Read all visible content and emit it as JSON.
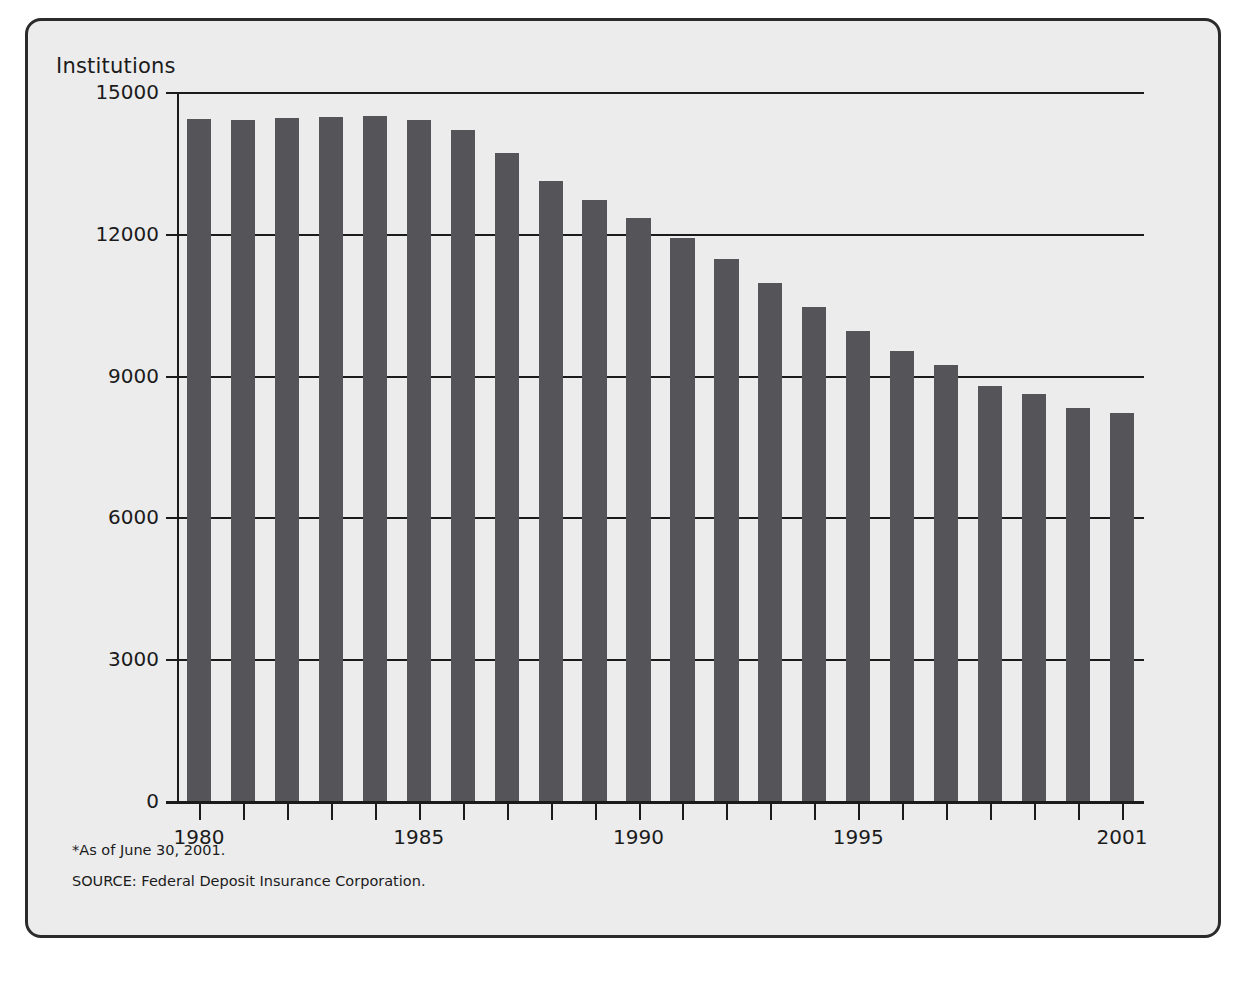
{
  "figure": {
    "y_axis_title": "Institutions",
    "footnote": "*As of June 30, 2001.",
    "source": "SOURCE: Federal Deposit Insurance Corporation.",
    "bar_color": "#555559",
    "background_color": "#ececed",
    "axis_color": "#1b1b1b"
  },
  "chart_data": {
    "type": "bar",
    "title": "",
    "subtitle": "",
    "xlabel": "",
    "ylabel": "Institutions",
    "ylim": [
      0,
      15000
    ],
    "yticks": [
      0,
      3000,
      6000,
      9000,
      12000,
      15000
    ],
    "ytick_labels": [
      "0",
      "3000",
      "6000",
      "9000",
      "12000",
      "15000"
    ],
    "grid": true,
    "legend": false,
    "categories": [
      "1980",
      "1981",
      "1982",
      "1983",
      "1984",
      "1985",
      "1986",
      "1987",
      "1988",
      "1989",
      "1990",
      "1991",
      "1992",
      "1993",
      "1994",
      "1995",
      "1996",
      "1997",
      "1998",
      "1999",
      "2000",
      "2001"
    ],
    "xtick_labels": [
      "1980",
      "",
      "",
      "",
      "",
      "1985",
      "",
      "",
      "",
      "",
      "1990",
      "",
      "",
      "",
      "",
      "1995",
      "",
      "",
      "",
      "",
      "",
      "2001"
    ],
    "values": [
      14434,
      14414,
      14451,
      14469,
      14496,
      14417,
      14199,
      13703,
      13123,
      12709,
      12343,
      11921,
      11463,
      10959,
      10451,
      9941,
      9528,
      9215,
      8774,
      8620,
      8315,
      8205
    ],
    "annotations": [
      "*As of June 30, 2001.",
      "SOURCE: Federal Deposit Insurance Corporation."
    ]
  }
}
